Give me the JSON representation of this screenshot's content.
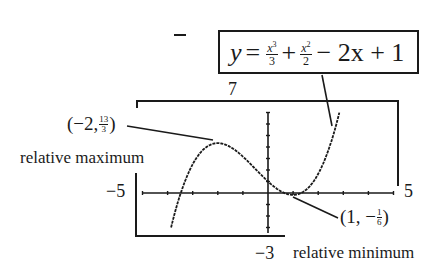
{
  "chart_data": {
    "type": "line",
    "title": "",
    "equation": "y = x^3/3 + x^2/2 - 2x + 1",
    "function": {
      "a3": 0.3333,
      "a2": 0.5,
      "a1": -2,
      "a0": 1
    },
    "window": {
      "xmin": -5,
      "xmax": 5,
      "ymin": -3,
      "ymax": 7
    },
    "xlim": [
      -5,
      5
    ],
    "ylim": [
      -3,
      7
    ],
    "xlabel": "",
    "ylabel": "",
    "grid": false,
    "tick_spacing": {
      "x": 1,
      "y": 1
    },
    "series": [
      {
        "name": "y = x^3/3 + x^2/2 - 2x + 1",
        "x": [
          -3.3,
          -3.0,
          -2.5,
          -2.0,
          -1.5,
          -1.0,
          -0.5,
          0.0,
          0.5,
          1.0,
          1.5,
          2.0,
          2.5,
          2.8
        ],
        "y": [
          -2.82,
          -0.5,
          3.0,
          4.33,
          3.88,
          3.17,
          1.96,
          1.0,
          0.17,
          -0.17,
          0.25,
          1.67,
          4.33,
          6.92
        ]
      }
    ],
    "annotations": [
      {
        "text": "(-2, 13/3)",
        "note": "relative maximum",
        "x": -2,
        "y": 4.333
      },
      {
        "text": "(1, -1/6)",
        "note": "relative minimum",
        "x": 1,
        "y": -0.1667
      }
    ],
    "window_labels": {
      "ymax": "7",
      "xmin": "-5",
      "xmax": "5",
      "ymin": "-3"
    }
  },
  "equation": {
    "y": "y",
    "equals": "=",
    "term1_num": "x",
    "term1_exp": "3",
    "term1_den": "3",
    "plus1": "+",
    "term2_num": "x",
    "term2_exp": "2",
    "term2_den": "2",
    "rest": "− 2x + 1"
  },
  "window_labels": {
    "top": "7",
    "left": "−5",
    "right": "5",
    "bottom": "−3"
  },
  "max_point": {
    "open": "(−2,",
    "num": "13",
    "den": "3",
    "close": ")"
  },
  "max_label": "relative maximum",
  "min_point": {
    "open": "(1, −",
    "num": "1",
    "den": "6",
    "close": ")"
  },
  "min_label": "relative minimum",
  "stray_mark": "−"
}
